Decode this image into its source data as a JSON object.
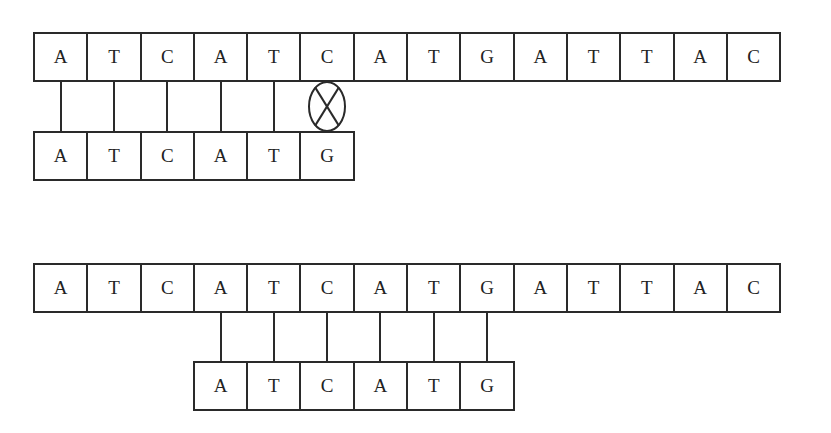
{
  "diagram": {
    "title": "",
    "stroke_color": "#2a2a2a",
    "background": "#ffffff",
    "box_width": 55.3,
    "box_height": 50,
    "sections": [
      {
        "id": "alignment-1",
        "reference": [
          "A",
          "T",
          "C",
          "A",
          "T",
          "C",
          "A",
          "T",
          "G",
          "A",
          "T",
          "T",
          "A",
          "C"
        ],
        "query": [
          "A",
          "T",
          "C",
          "A",
          "T",
          "G"
        ],
        "query_offset": 0,
        "matches": [
          0,
          1,
          2,
          3,
          4
        ],
        "mismatches": [
          5
        ]
      },
      {
        "id": "alignment-2",
        "reference": [
          "A",
          "T",
          "C",
          "A",
          "T",
          "C",
          "A",
          "T",
          "G",
          "A",
          "T",
          "T",
          "A",
          "C"
        ],
        "query": [
          "A",
          "T",
          "C",
          "A",
          "T",
          "G"
        ],
        "query_offset": 3,
        "matches": [
          0,
          1,
          2,
          3,
          4,
          5
        ],
        "mismatches": []
      }
    ]
  }
}
